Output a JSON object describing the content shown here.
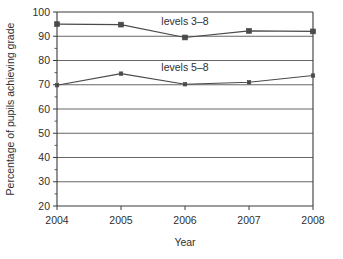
{
  "chart_data": {
    "type": "line",
    "title": "",
    "xlabel": "Year",
    "ylabel": "Percentage of pupils achieving grade",
    "x": [
      2004,
      2005,
      2006,
      2007,
      2008
    ],
    "categories": [
      "2004",
      "2005",
      "2006",
      "2007",
      "2008"
    ],
    "xlim": [
      2004,
      2008
    ],
    "ylim": [
      20,
      100
    ],
    "ytick_labels": [
      "20",
      "30",
      "40",
      "50",
      "60",
      "70",
      "80",
      "90",
      "100"
    ],
    "yticks": [
      20,
      30,
      40,
      50,
      60,
      70,
      80,
      90,
      100
    ],
    "y_minor_tick_step": 5,
    "grid": "horizontal",
    "legend_position": "inline-annotations",
    "series": [
      {
        "name": "levels 3–8",
        "label": "levels 3–8",
        "marker": "square",
        "color": "#4a4a4a",
        "values": [
          95,
          94.8,
          89.5,
          92.2,
          92
        ]
      },
      {
        "name": "levels 5–8",
        "label": "levels 5–8",
        "marker": "small-square",
        "color": "#4a4a4a",
        "values": [
          69.8,
          74.6,
          70.2,
          71,
          73.8
        ]
      }
    ],
    "annotations": [
      {
        "text": "levels 3–8",
        "x": 2006,
        "y": 94.5
      },
      {
        "text": "levels 5–8",
        "x": 2006,
        "y": 75.5
      }
    ],
    "colors": {
      "line": "#4a4a4a",
      "grid": "#555555",
      "axis": "#3a3a3a",
      "text": "#2f2f2f",
      "background": "#ffffff"
    }
  }
}
